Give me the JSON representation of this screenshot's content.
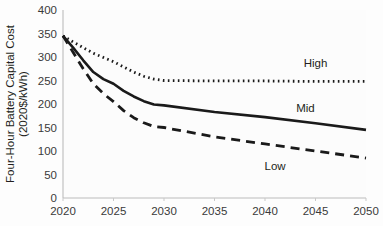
{
  "chart_data": {
    "type": "line",
    "title": "",
    "xlabel": "",
    "ylabel": "Four-Hour Battery Capital Cost",
    "ylabel_line2": "(2020$/kWh)",
    "x": [
      2020,
      2025,
      2030,
      2035,
      2040,
      2045,
      2050
    ],
    "xlim": [
      2020,
      2050
    ],
    "ylim": [
      0,
      400
    ],
    "xticks": [
      "2020",
      "2025",
      "2030",
      "2035",
      "2040",
      "2045",
      "2050"
    ],
    "yticks": [
      "0",
      "50",
      "100",
      "150",
      "200",
      "250",
      "300",
      "350",
      "400"
    ],
    "ytick_values": [
      0,
      50,
      100,
      150,
      200,
      250,
      300,
      350,
      400
    ],
    "xtick_values": [
      2020,
      2025,
      2030,
      2035,
      2040,
      2045,
      2050
    ],
    "grid": false,
    "legend_position": "inline-right",
    "series": [
      {
        "name": "High",
        "label": "High",
        "style": "dotted",
        "color": "#1a1a1a",
        "x": [
          2020,
          2021,
          2022,
          2023,
          2024,
          2025,
          2026,
          2027,
          2028,
          2029,
          2030,
          2035,
          2040,
          2045,
          2050
        ],
        "values": [
          345,
          332,
          320,
          308,
          299,
          290,
          279,
          268,
          259,
          253,
          250,
          249,
          249,
          248,
          248
        ],
        "label_x": 2045,
        "label_y": 278
      },
      {
        "name": "Mid",
        "label": "Mid",
        "style": "solid",
        "color": "#1a1a1a",
        "x": [
          2020,
          2021,
          2022,
          2023,
          2024,
          2025,
          2026,
          2027,
          2028,
          2029,
          2030,
          2035,
          2040,
          2045,
          2050
        ],
        "values": [
          345,
          320,
          293,
          268,
          253,
          243,
          228,
          216,
          206,
          199,
          197,
          183,
          172,
          159,
          145
        ],
        "label_x": 2044,
        "label_y": 183
      },
      {
        "name": "Low",
        "label": "Low",
        "style": "dashed",
        "color": "#1a1a1a",
        "x": [
          2020,
          2021,
          2022,
          2023,
          2024,
          2025,
          2026,
          2027,
          2028,
          2029,
          2030,
          2035,
          2040,
          2045,
          2050
        ],
        "values": [
          345,
          310,
          275,
          243,
          222,
          205,
          186,
          171,
          160,
          152,
          150,
          130,
          115,
          100,
          85
        ],
        "label_x": 2041,
        "label_y": 60
      }
    ]
  },
  "plot_geometry": {
    "left": 63,
    "right": 366,
    "top": 10,
    "bottom": 198
  }
}
